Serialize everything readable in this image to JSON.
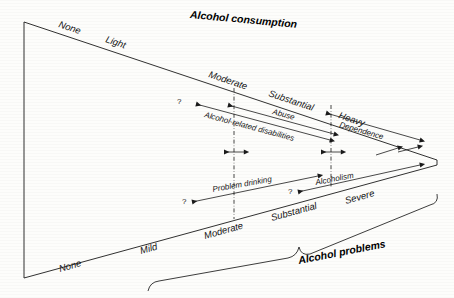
{
  "figure": {
    "top_title": "Alcohol consumption",
    "bottom_title": "Alcohol problems"
  },
  "consumption_scale": [
    {
      "label": "None"
    },
    {
      "label": "Light"
    },
    {
      "label": "Moderate"
    },
    {
      "label": "Substantial"
    },
    {
      "label": "Heavy"
    }
  ],
  "problems_scale": [
    {
      "label": "None"
    },
    {
      "label": "Mild"
    },
    {
      "label": "Moderate"
    },
    {
      "label": "Substantial"
    },
    {
      "label": "Severe"
    }
  ],
  "bands": [
    {
      "label": "Alcohol-related disabilities"
    },
    {
      "label": "Abuse"
    },
    {
      "label": "Dependence"
    },
    {
      "label": "Problem drinking"
    },
    {
      "label": "Alcoholism"
    }
  ],
  "uncertainty_marks": [
    {
      "label": "?"
    },
    {
      "label": "?"
    },
    {
      "label": "?"
    }
  ],
  "colors": {
    "ink": "#1a1a1a",
    "paper": "#fdfdfb"
  }
}
